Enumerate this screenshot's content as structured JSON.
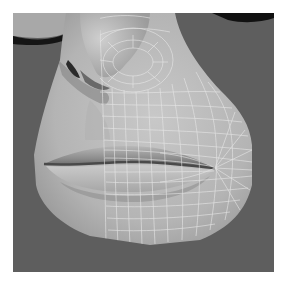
{
  "render": {
    "subject": "3D face mesh close-up: nose and lips",
    "overlay": "wireframe on right half",
    "colors": {
      "page_background": "#ffffff",
      "viewport_background": "#5e5e5e",
      "skin_light": "#c4c4c4",
      "skin_mid": "#a8a8a8",
      "skin_shadow": "#6a6a6a",
      "nostril": "#5a5a5a",
      "wire": "#e6e6e6",
      "dark_edge": "#111111"
    }
  }
}
